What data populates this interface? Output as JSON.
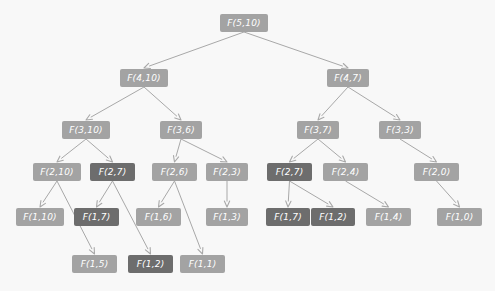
{
  "diagram": {
    "colors": {
      "background": "#f8f8f8",
      "node_normal": "#a3a3a3",
      "node_repeated": "#6d6d6d",
      "edge": "#a8a8a8",
      "node_text": "#ffffff"
    },
    "legend": {
      "normal_meaning": "subproblem computed once",
      "repeated_meaning": "repeated subproblem"
    },
    "nodes": [
      {
        "id": "n0",
        "label": "F(5,10)",
        "level": 0,
        "x": 220,
        "y": 14,
        "w": 48,
        "state": "light"
      },
      {
        "id": "n1",
        "label": "F(4,10)",
        "level": 1,
        "x": 120,
        "y": 69,
        "w": 48,
        "state": "light"
      },
      {
        "id": "n2",
        "label": "F(4,7)",
        "level": 1,
        "x": 327,
        "y": 69,
        "w": 42,
        "state": "light"
      },
      {
        "id": "n3",
        "label": "F(3,10)",
        "level": 2,
        "x": 62,
        "y": 121,
        "w": 48,
        "state": "light"
      },
      {
        "id": "n4",
        "label": "F(3,6)",
        "level": 2,
        "x": 160,
        "y": 121,
        "w": 42,
        "state": "light"
      },
      {
        "id": "n5",
        "label": "F(3,7)",
        "level": 2,
        "x": 297,
        "y": 121,
        "w": 42,
        "state": "light"
      },
      {
        "id": "n6",
        "label": "F(3,3)",
        "level": 2,
        "x": 379,
        "y": 121,
        "w": 42,
        "state": "light"
      },
      {
        "id": "n7",
        "label": "F(2,10)",
        "level": 3,
        "x": 33,
        "y": 163,
        "w": 48,
        "state": "light"
      },
      {
        "id": "n8",
        "label": "F(2,7)",
        "level": 3,
        "x": 90,
        "y": 163,
        "w": 45,
        "state": "dark"
      },
      {
        "id": "n9",
        "label": "F(2,6)",
        "level": 3,
        "x": 152,
        "y": 163,
        "w": 45,
        "state": "light"
      },
      {
        "id": "n10",
        "label": "F(2,3)",
        "level": 3,
        "x": 206,
        "y": 163,
        "w": 42,
        "state": "light"
      },
      {
        "id": "n11",
        "label": "F(2,7)",
        "level": 3,
        "x": 267,
        "y": 163,
        "w": 45,
        "state": "dark"
      },
      {
        "id": "n12",
        "label": "F(2,4)",
        "level": 3,
        "x": 323,
        "y": 163,
        "w": 45,
        "state": "light"
      },
      {
        "id": "n13",
        "label": "F(2,0)",
        "level": 3,
        "x": 414,
        "y": 163,
        "w": 45,
        "state": "light"
      },
      {
        "id": "n14",
        "label": "F(1,10)",
        "level": 4,
        "x": 16,
        "y": 208,
        "w": 48,
        "state": "light"
      },
      {
        "id": "n15",
        "label": "F(1,7)",
        "level": 4,
        "x": 74,
        "y": 208,
        "w": 45,
        "state": "dark"
      },
      {
        "id": "n16",
        "label": "F(1,6)",
        "level": 4,
        "x": 136,
        "y": 208,
        "w": 45,
        "state": "light"
      },
      {
        "id": "n17",
        "label": "F(1,3)",
        "level": 4,
        "x": 206,
        "y": 208,
        "w": 42,
        "state": "light"
      },
      {
        "id": "n18",
        "label": "F(1,7)",
        "level": 4,
        "x": 266,
        "y": 208,
        "w": 44,
        "state": "dark"
      },
      {
        "id": "n19",
        "label": "F(1,2)",
        "level": 4,
        "x": 311,
        "y": 208,
        "w": 44,
        "state": "dark"
      },
      {
        "id": "n20",
        "label": "F(1,4)",
        "level": 4,
        "x": 366,
        "y": 208,
        "w": 45,
        "state": "light"
      },
      {
        "id": "n21",
        "label": "F(1,0)",
        "level": 4,
        "x": 437,
        "y": 208,
        "w": 45,
        "state": "light"
      },
      {
        "id": "n22",
        "label": "F(1,5)",
        "level": 5,
        "x": 72,
        "y": 255,
        "w": 45,
        "state": "light"
      },
      {
        "id": "n23",
        "label": "F(1,2)",
        "level": 5,
        "x": 128,
        "y": 255,
        "w": 45,
        "state": "dark"
      },
      {
        "id": "n24",
        "label": "F(1,1)",
        "level": 5,
        "x": 180,
        "y": 255,
        "w": 45,
        "state": "light"
      }
    ],
    "edges": [
      {
        "from": "n0",
        "to": "n1"
      },
      {
        "from": "n0",
        "to": "n2"
      },
      {
        "from": "n1",
        "to": "n3"
      },
      {
        "from": "n1",
        "to": "n4"
      },
      {
        "from": "n2",
        "to": "n5"
      },
      {
        "from": "n2",
        "to": "n6"
      },
      {
        "from": "n3",
        "to": "n7"
      },
      {
        "from": "n3",
        "to": "n8"
      },
      {
        "from": "n4",
        "to": "n9"
      },
      {
        "from": "n4",
        "to": "n10"
      },
      {
        "from": "n5",
        "to": "n11"
      },
      {
        "from": "n5",
        "to": "n12"
      },
      {
        "from": "n6",
        "to": "n13"
      },
      {
        "from": "n7",
        "to": "n14"
      },
      {
        "from": "n7",
        "to": "n22"
      },
      {
        "from": "n8",
        "to": "n15"
      },
      {
        "from": "n8",
        "to": "n23"
      },
      {
        "from": "n9",
        "to": "n16"
      },
      {
        "from": "n9",
        "to": "n24"
      },
      {
        "from": "n10",
        "to": "n17"
      },
      {
        "from": "n11",
        "to": "n18"
      },
      {
        "from": "n11",
        "to": "n19"
      },
      {
        "from": "n12",
        "to": "n20"
      },
      {
        "from": "n13",
        "to": "n21"
      }
    ]
  }
}
